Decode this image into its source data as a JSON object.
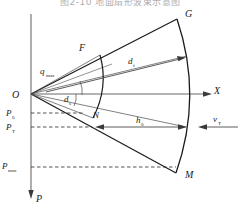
{
  "figure": {
    "title": "图2-10  地面扇形波束示意图",
    "axes": {
      "x_axis_label": "X",
      "p_axis_label": "P",
      "origin_label": "O"
    },
    "points": [
      {
        "id": "G",
        "label": "G"
      },
      {
        "id": "F",
        "label": "F"
      },
      {
        "id": "N",
        "label": "N"
      },
      {
        "id": "M",
        "label": "M"
      }
    ],
    "annotations": [
      {
        "id": "q_max",
        "base": "q",
        "subscript": "max"
      },
      {
        "id": "d_s",
        "base": "d",
        "subscript": "s"
      },
      {
        "id": "d_f",
        "base": "d",
        "subscript": "f"
      },
      {
        "id": "h_0",
        "base": "h",
        "subscript": "0"
      },
      {
        "id": "v_T",
        "base": "v",
        "subscript": "T"
      }
    ],
    "level_lines": [
      {
        "id": "P0",
        "base": "P",
        "subscript": "0"
      },
      {
        "id": "PT",
        "base": "P",
        "subscript": "T"
      },
      {
        "id": "Pmax",
        "base": "P",
        "subscript": "max"
      }
    ],
    "colors": {
      "stroke": "#1a1a1a",
      "axis": "#555555",
      "background": "#ffffff"
    }
  }
}
